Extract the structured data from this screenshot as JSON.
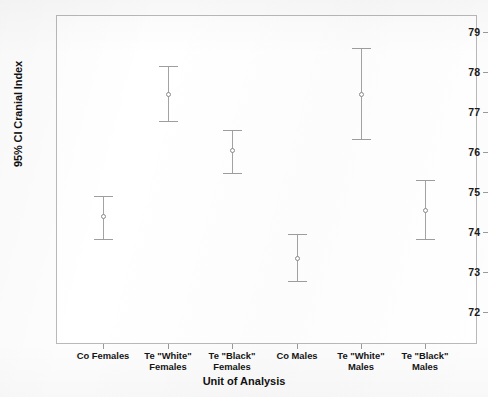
{
  "chart_data": {
    "type": "scatter",
    "title": "",
    "xlabel": "Unit of Analysis",
    "ylabel": "95% CI Cranial Index",
    "ylim": [
      71.3,
      79.35
    ],
    "yticks": [
      72,
      73,
      74,
      75,
      76,
      77,
      78,
      79
    ],
    "ytick_labels": [
      "72",
      "73",
      "74",
      "75",
      "76",
      "77",
      "78",
      "79"
    ],
    "grid": false,
    "legend": false,
    "categories": [
      "Co Females",
      "Te \"White\"\nFemales",
      "Te \"Black\"\nFemales",
      "Co Males",
      "Te \"White\"\nMales",
      "Te \"Black\"\nMales"
    ],
    "series": [
      {
        "name": "Mean Cranial Index with 95% CI",
        "values": [
          74.4,
          77.45,
          76.05,
          73.35,
          77.45,
          74.55
        ],
        "ci_lower": [
          73.8,
          76.75,
          75.45,
          72.75,
          76.3,
          73.8
        ],
        "ci_upper": [
          74.9,
          78.15,
          76.55,
          73.95,
          78.6,
          75.3
        ]
      }
    ],
    "marker_color": "#8b8b8b",
    "errorbar_color": "#a3a3a3",
    "frame_color": "#b9b9b9"
  }
}
